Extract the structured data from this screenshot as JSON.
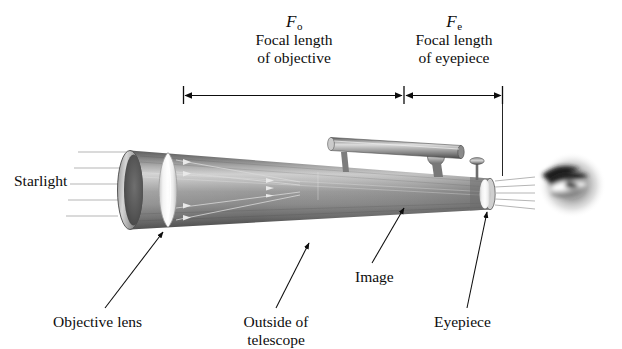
{
  "figure": {
    "kind": "refracting-telescope-ray-diagram",
    "background_color": "#ffffff",
    "ink_color": "#0d0d0d"
  },
  "dimensions": {
    "objective": {
      "symbol": "F",
      "subscript": "o",
      "line1": "Focal length",
      "line2": "of objective"
    },
    "eyepiece": {
      "symbol": "F",
      "subscript": "e",
      "line1": "Focal length",
      "line2": "of eyepiece"
    }
  },
  "labels": {
    "starlight": "Starlight",
    "objective_lens": "Objective lens",
    "outside_line1": "Outside of",
    "outside_line2": "telescope",
    "image": "Image",
    "eyepiece": "Eyepiece"
  },
  "parts": {
    "tube": "telescope-tube",
    "objective_lens": "objective-lens",
    "eyepiece_lens": "eyepiece-lens",
    "finder_scope": "finder-scope",
    "focus_knob": "focus-knob",
    "eye": "observer-eye",
    "incoming_rays": "starlight-rays",
    "exit_rays": "exit-rays"
  }
}
